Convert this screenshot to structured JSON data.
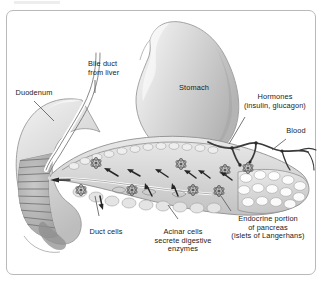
{
  "figure": {
    "frame_color": "#b9b9b9",
    "background_color": "#ffffff"
  },
  "labels": [
    {
      "name": "duodenum",
      "lines": [
        "Duodenum"
      ]
    },
    {
      "name": "bile-duct",
      "lines": [
        "Bile duct",
        "from liver"
      ]
    },
    {
      "name": "stomach",
      "lines": [
        "Stomach"
      ]
    },
    {
      "name": "hormones",
      "lines": [
        "Hormones",
        "(insulin, glucagon)"
      ]
    },
    {
      "name": "blood",
      "lines": [
        "Blood"
      ]
    },
    {
      "name": "duct-cells",
      "lines": [
        "Duct cells"
      ]
    },
    {
      "name": "acinar-cells",
      "lines": [
        "Acinar cells",
        "secrete digestive",
        "enzymes"
      ]
    },
    {
      "name": "endocrine-portion",
      "lines": [
        "Endocrine portion",
        "of pancreas",
        "(islets of Langerhans)"
      ]
    }
  ],
  "structures": {
    "stomach": "stomach",
    "duodenum": "duodenum",
    "bile_duct": "bile duct",
    "pancreas_body": "pancreas",
    "pancreatic_duct": "pancreatic duct",
    "islets": "islets of Langerhans",
    "blood_vessel": "blood vessel"
  },
  "colors": {
    "outline": "#6e6e6e",
    "organ_fill": "#d9d9d9",
    "organ_light": "#f0f0f0",
    "vessel": "#3a3a3a",
    "text": "#1b1b1b"
  }
}
